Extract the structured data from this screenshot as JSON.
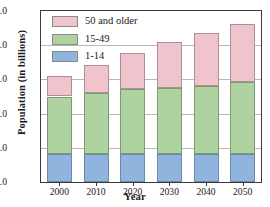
{
  "chart_data": {
    "type": "bar",
    "title": "",
    "xlabel": "Year",
    "ylabel": "Population (in billions)",
    "categories": [
      "2000",
      "2010",
      "2020",
      "2030",
      "2040",
      "2050"
    ],
    "series": [
      {
        "name": "1-14",
        "color": "#8fb4dd",
        "values": [
          0.82,
          0.82,
          0.82,
          0.82,
          0.82,
          0.82
        ]
      },
      {
        "name": "15-49",
        "color": "#aed3a0",
        "values": [
          1.68,
          1.78,
          1.89,
          1.94,
          1.99,
          2.1
        ]
      },
      {
        "name": "50 and older",
        "color": "#f0c4cc",
        "values": [
          0.6,
          0.81,
          1.06,
          1.34,
          1.55,
          1.69
        ]
      }
    ],
    "cumulative_tops": [
      [
        0.82,
        2.5,
        3.1
      ],
      [
        0.82,
        2.6,
        3.41
      ],
      [
        0.82,
        2.71,
        3.77
      ],
      [
        0.82,
        2.76,
        4.1
      ],
      [
        0.82,
        2.81,
        4.36
      ],
      [
        0.82,
        2.92,
        4.61
      ]
    ],
    "totals": [
      3.1,
      3.41,
      3.77,
      4.1,
      4.36,
      4.61
    ],
    "stacked": true,
    "ylim": [
      0.0,
      5.0
    ],
    "ytick_values": [
      0.0,
      1.0,
      2.0,
      3.0,
      4.0,
      5.0
    ],
    "ytick_labels": [
      "0.0",
      "1.0",
      "2.0",
      "3.0",
      "4.0",
      "5.0"
    ],
    "grid": true,
    "grid_axis": "y",
    "legend_position": "top-left",
    "legend_order": [
      "50 and older",
      "15-49",
      "1-14"
    ]
  }
}
